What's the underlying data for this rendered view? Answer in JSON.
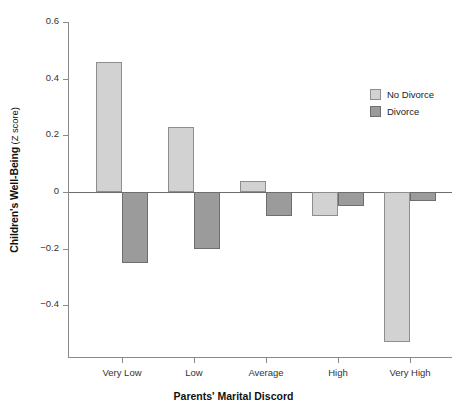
{
  "chart_data": {
    "type": "bar",
    "title": "",
    "xlabel": "Parents' Marital Discord",
    "ylabel": "Children's Well-Being",
    "ylabel_unit": "(Z score)",
    "categories": [
      "Very Low",
      "Low",
      "Average",
      "High",
      "Very High"
    ],
    "series": [
      {
        "name": "No Divorce",
        "color": "#d2d2d2",
        "values": [
          0.46,
          0.23,
          0.04,
          -0.085,
          -0.53
        ]
      },
      {
        "name": "Divorce",
        "color": "#9b9b9b",
        "values": [
          -0.25,
          -0.2,
          -0.085,
          -0.05,
          -0.03
        ]
      }
    ],
    "ylim": [
      -0.6,
      0.6
    ],
    "yticks": [
      0.6,
      0.4,
      0.2,
      0,
      -0.2,
      -0.4
    ],
    "ytick_labels": [
      "0.6",
      "0.4",
      "0.2",
      "0",
      "−0.2",
      "−0.4"
    ],
    "grid": false,
    "legend_position": "upper right",
    "axis_color": "#8a8a8a",
    "zero_line_color": "#6d6d6d"
  },
  "legend": {
    "entries": [
      {
        "label": "No Divorce"
      },
      {
        "label": "Divorce"
      }
    ]
  }
}
